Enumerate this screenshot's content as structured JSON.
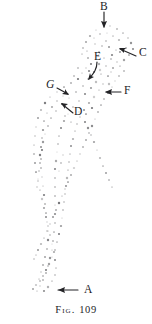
{
  "figure": {
    "caption_prefix": "Fig.",
    "caption_number": "109",
    "caption_full": "FIG. 109",
    "background_color": "#ffffff",
    "ink_color": "#232326",
    "stipple_color": "#6f6f72"
  },
  "labels": [
    {
      "id": "A",
      "text": "A",
      "x": 84,
      "y": 290,
      "arrow_direction": "left",
      "style": "roman"
    },
    {
      "id": "B",
      "text": "B",
      "x": 100,
      "y": 6,
      "arrow_direction": "down",
      "style": "roman"
    },
    {
      "id": "C",
      "text": "C",
      "x": 139,
      "y": 53,
      "arrow_direction": "up-left",
      "style": "roman"
    },
    {
      "id": "D",
      "text": "D",
      "x": 74,
      "y": 111,
      "arrow_direction": "up-left",
      "style": "roman"
    },
    {
      "id": "E",
      "text": "E",
      "x": 94,
      "y": 56,
      "arrow_direction": "down-left-curved",
      "style": "roman"
    },
    {
      "id": "F",
      "text": "F",
      "x": 124,
      "y": 89,
      "arrow_direction": "left",
      "style": "roman"
    },
    {
      "id": "G",
      "text": "G",
      "x": 48,
      "y": 84,
      "arrow_direction": "down-right",
      "style": "italic"
    }
  ],
  "chart_data": {
    "type": "scatter",
    "title": "FIG. 109",
    "xlabel": "",
    "ylabel": "",
    "xlim": [
      0,
      152
    ],
    "ylim": [
      0,
      324
    ],
    "grid": false,
    "legend": "none",
    "marker": "stipple-dot",
    "annotations": [
      "A",
      "B",
      "C",
      "D",
      "E",
      "F",
      "G"
    ],
    "points": [
      [
        103,
        25
      ],
      [
        110,
        26
      ],
      [
        117,
        29
      ],
      [
        96,
        30
      ],
      [
        123,
        33
      ],
      [
        90,
        36
      ],
      [
        128,
        38
      ],
      [
        86,
        42
      ],
      [
        131,
        43
      ],
      [
        83,
        48
      ],
      [
        133,
        49
      ],
      [
        82,
        54
      ],
      [
        129,
        55
      ],
      [
        100,
        34
      ],
      [
        107,
        33
      ],
      [
        113,
        36
      ],
      [
        119,
        40
      ],
      [
        95,
        44
      ],
      [
        88,
        58
      ],
      [
        124,
        60
      ],
      [
        102,
        46
      ],
      [
        109,
        47
      ],
      [
        116,
        50
      ],
      [
        97,
        56
      ],
      [
        91,
        64
      ],
      [
        120,
        66
      ],
      [
        104,
        58
      ],
      [
        111,
        59
      ],
      [
        86,
        68
      ],
      [
        124,
        71
      ],
      [
        99,
        64
      ],
      [
        106,
        66
      ],
      [
        113,
        68
      ],
      [
        82,
        73
      ],
      [
        119,
        76
      ],
      [
        94,
        72
      ],
      [
        101,
        74
      ],
      [
        108,
        76
      ],
      [
        78,
        79
      ],
      [
        115,
        81
      ],
      [
        88,
        79
      ],
      [
        96,
        82
      ],
      [
        103,
        84
      ],
      [
        71,
        83
      ],
      [
        112,
        87
      ],
      [
        83,
        86
      ],
      [
        91,
        88
      ],
      [
        99,
        90
      ],
      [
        64,
        87
      ],
      [
        108,
        93
      ],
      [
        76,
        92
      ],
      [
        85,
        94
      ],
      [
        94,
        97
      ],
      [
        57,
        92
      ],
      [
        104,
        99
      ],
      [
        69,
        98
      ],
      [
        79,
        101
      ],
      [
        89,
        103
      ],
      [
        50,
        97
      ],
      [
        101,
        105
      ],
      [
        62,
        104
      ],
      [
        73,
        107
      ],
      [
        84,
        110
      ],
      [
        45,
        103
      ],
      [
        98,
        112
      ],
      [
        56,
        111
      ],
      [
        68,
        114
      ],
      [
        80,
        117
      ],
      [
        41,
        110
      ],
      [
        95,
        119
      ],
      [
        51,
        118
      ],
      [
        64,
        121
      ],
      [
        77,
        124
      ],
      [
        38,
        118
      ],
      [
        92,
        126
      ],
      [
        48,
        126
      ],
      [
        61,
        128
      ],
      [
        75,
        131
      ],
      [
        36,
        127
      ],
      [
        89,
        133
      ],
      [
        45,
        134
      ],
      [
        59,
        136
      ],
      [
        73,
        139
      ],
      [
        35,
        136
      ],
      [
        86,
        140
      ],
      [
        43,
        142
      ],
      [
        58,
        144
      ],
      [
        71,
        146
      ],
      [
        34,
        145
      ],
      [
        83,
        147
      ],
      [
        42,
        150
      ],
      [
        57,
        152
      ],
      [
        70,
        154
      ],
      [
        34,
        154
      ],
      [
        80,
        154
      ],
      [
        41,
        159
      ],
      [
        56,
        161
      ],
      [
        69,
        162
      ],
      [
        35,
        163
      ],
      [
        77,
        161
      ],
      [
        41,
        168
      ],
      [
        55,
        169
      ],
      [
        68,
        170
      ],
      [
        36,
        172
      ],
      [
        74,
        168
      ],
      [
        42,
        177
      ],
      [
        55,
        178
      ],
      [
        67,
        178
      ],
      [
        38,
        181
      ],
      [
        71,
        175
      ],
      [
        43,
        186
      ],
      [
        55,
        187
      ],
      [
        66,
        186
      ],
      [
        40,
        190
      ],
      [
        68,
        182
      ],
      [
        44,
        195
      ],
      [
        55,
        196
      ],
      [
        65,
        194
      ],
      [
        42,
        199
      ],
      [
        65,
        189
      ],
      [
        45,
        204
      ],
      [
        55,
        205
      ],
      [
        64,
        202
      ],
      [
        44,
        208
      ],
      [
        62,
        196
      ],
      [
        46,
        213
      ],
      [
        55,
        214
      ],
      [
        63,
        210
      ],
      [
        46,
        217
      ],
      [
        59,
        203
      ],
      [
        47,
        222
      ],
      [
        55,
        223
      ],
      [
        62,
        218
      ],
      [
        48,
        226
      ],
      [
        56,
        210
      ],
      [
        48,
        231
      ],
      [
        54,
        232
      ],
      [
        61,
        226
      ],
      [
        50,
        235
      ],
      [
        53,
        217
      ],
      [
        48,
        240
      ],
      [
        53,
        241
      ],
      [
        59,
        234
      ],
      [
        52,
        244
      ],
      [
        50,
        224
      ],
      [
        47,
        249
      ],
      [
        52,
        250
      ],
      [
        57,
        242
      ],
      [
        54,
        252
      ],
      [
        47,
        231
      ],
      [
        45,
        257
      ],
      [
        50,
        258
      ],
      [
        55,
        250
      ],
      [
        55,
        260
      ],
      [
        44,
        238
      ],
      [
        43,
        265
      ],
      [
        48,
        266
      ],
      [
        52,
        257
      ],
      [
        56,
        268
      ],
      [
        41,
        244
      ],
      [
        41,
        272
      ],
      [
        46,
        273
      ],
      [
        49,
        264
      ],
      [
        55,
        275
      ],
      [
        38,
        250
      ],
      [
        39,
        279
      ],
      [
        43,
        280
      ],
      [
        46,
        270
      ],
      [
        52,
        281
      ],
      [
        36,
        255
      ],
      [
        36,
        285
      ],
      [
        40,
        286
      ],
      [
        43,
        276
      ],
      [
        48,
        287
      ],
      [
        34,
        259
      ],
      [
        33,
        289
      ],
      [
        37,
        291
      ],
      [
        40,
        281
      ],
      [
        44,
        291
      ],
      [
        71,
        122
      ],
      [
        86,
        114
      ],
      [
        92,
        108
      ],
      [
        79,
        112
      ],
      [
        65,
        116
      ],
      [
        109,
        84
      ],
      [
        117,
        62
      ],
      [
        126,
        48
      ],
      [
        94,
        38
      ],
      [
        106,
        41
      ],
      [
        120,
        52
      ],
      [
        87,
        51
      ],
      [
        99,
        52
      ],
      [
        112,
        55
      ],
      [
        78,
        68
      ],
      [
        89,
        71
      ],
      [
        100,
        70
      ],
      [
        111,
        72
      ],
      [
        74,
        76
      ],
      [
        63,
        96
      ],
      [
        57,
        101
      ],
      [
        52,
        107
      ],
      [
        47,
        113
      ],
      [
        44,
        121
      ],
      [
        43,
        130
      ],
      [
        42,
        138
      ],
      [
        41,
        147
      ],
      [
        40,
        155
      ],
      [
        40,
        163
      ],
      [
        39,
        171
      ],
      [
        38,
        179
      ],
      [
        37,
        187
      ],
      [
        100,
        158
      ],
      [
        97,
        150
      ],
      [
        103,
        166
      ],
      [
        94,
        142
      ],
      [
        91,
        135
      ],
      [
        106,
        173
      ],
      [
        88,
        128
      ],
      [
        109,
        180
      ],
      [
        85,
        122
      ],
      [
        112,
        187
      ],
      [
        63,
        155
      ],
      [
        61,
        163
      ],
      [
        59,
        171
      ]
    ]
  }
}
